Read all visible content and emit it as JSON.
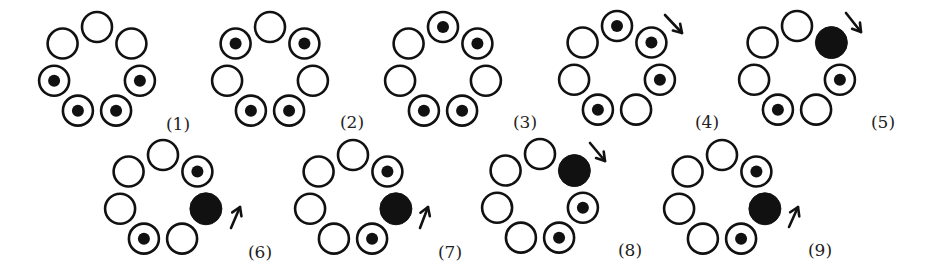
{
  "layout": {
    "ring_radius": 44,
    "circle_radius": 15,
    "dot_radius": 6,
    "filled_radius": 16,
    "positions_order": [
      "top",
      "upper-right",
      "right",
      "lower-right",
      "lower-left",
      "left",
      "upper-left"
    ]
  },
  "legend": {
    "E": "empty circle",
    "D": "circle with dot",
    "F": "filled circle"
  },
  "figures": [
    {
      "label": "(1)",
      "cx": 97,
      "cy": 71,
      "label_x": 178,
      "label_y": 130,
      "states": [
        "E",
        "E",
        "D",
        "D",
        "D",
        "D",
        "E"
      ],
      "arrow": null
    },
    {
      "label": "(2)",
      "cx": 270,
      "cy": 71,
      "label_x": 352,
      "label_y": 128,
      "states": [
        "E",
        "D",
        "E",
        "D",
        "D",
        "E",
        "D"
      ],
      "arrow": null
    },
    {
      "label": "(3)",
      "cx": 443,
      "cy": 71,
      "label_x": 525,
      "label_y": 128,
      "states": [
        "D",
        "D",
        "E",
        "D",
        "D",
        "E",
        "E"
      ],
      "arrow": null
    },
    {
      "label": "(4)",
      "cx": 617,
      "cy": 70,
      "label_x": 707,
      "label_y": 128,
      "states": [
        "D",
        "D",
        "D",
        "E",
        "D",
        "E",
        "E"
      ],
      "arrow": {
        "dir": "down-right",
        "x1": 665,
        "y1": 15,
        "x2": 682,
        "y2": 33
      }
    },
    {
      "label": "(5)",
      "cx": 797,
      "cy": 70,
      "label_x": 883,
      "label_y": 128,
      "states": [
        "E",
        "F",
        "D",
        "E",
        "D",
        "E",
        "E"
      ],
      "arrow": {
        "dir": "down-right",
        "x1": 846,
        "y1": 13,
        "x2": 861,
        "y2": 32
      }
    },
    {
      "label": "(6)",
      "cx": 163,
      "cy": 199,
      "label_x": 260,
      "label_y": 258,
      "states": [
        "E",
        "D",
        "F",
        "E",
        "D",
        "E",
        "E"
      ],
      "arrow": {
        "dir": "up-right",
        "x1": 231,
        "y1": 228,
        "x2": 240,
        "y2": 207
      }
    },
    {
      "label": "(7)",
      "cx": 353,
      "cy": 199,
      "label_x": 450,
      "label_y": 258,
      "states": [
        "E",
        "D",
        "F",
        "D",
        "E",
        "E",
        "E"
      ],
      "arrow": {
        "dir": "up-right",
        "x1": 420,
        "y1": 228,
        "x2": 428,
        "y2": 207
      }
    },
    {
      "label": "(8)",
      "cx": 540,
      "cy": 198,
      "label_x": 630,
      "label_y": 256,
      "states": [
        "E",
        "F",
        "D",
        "D",
        "E",
        "E",
        "E"
      ],
      "arrow": {
        "dir": "down-right",
        "x1": 590,
        "y1": 143,
        "x2": 605,
        "y2": 161
      }
    },
    {
      "label": "(9)",
      "cx": 722,
      "cy": 199,
      "label_x": 820,
      "label_y": 256,
      "states": [
        "E",
        "D",
        "F",
        "D",
        "E",
        "E",
        "E"
      ],
      "arrow": {
        "dir": "up-right",
        "x1": 789,
        "y1": 227,
        "x2": 798,
        "y2": 207
      }
    }
  ]
}
